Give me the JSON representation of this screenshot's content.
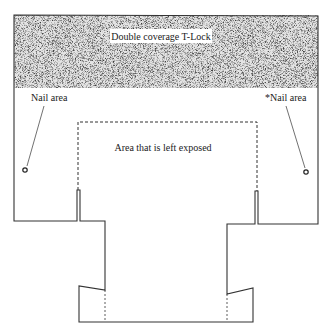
{
  "diagram": {
    "title_label": "Double coverage T-Lock",
    "nail_area_left": "Nail area",
    "nail_area_right": "*Nail area",
    "exposed_area_label": "Area that is left exposed",
    "colors": {
      "line": "#333333",
      "texture_dark": "#555555",
      "texture_light": "#d0d0d0",
      "background": "#ffffff"
    }
  }
}
